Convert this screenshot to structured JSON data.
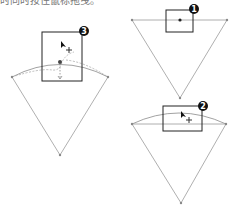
{
  "caption": {
    "text": "时同时按住鼠标拖曳。"
  },
  "steps": [
    {
      "number": "1",
      "description": "click midpoint of top edge"
    },
    {
      "number": "2",
      "description": "drag to form arc"
    },
    {
      "number": "3",
      "description": "arc bending with cursor"
    }
  ],
  "colors": {
    "edge": "#9a9a9a",
    "box": "#222222",
    "marker": "#111111"
  }
}
